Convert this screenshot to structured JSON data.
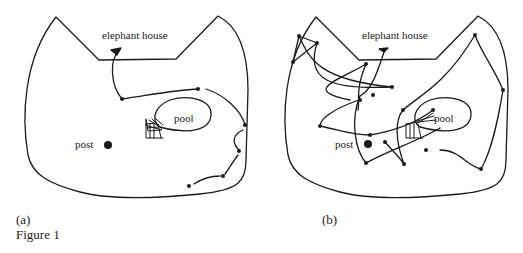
{
  "figure": {
    "caption": "Figure 1",
    "panels": [
      {
        "id": "a",
        "label": "(a)",
        "labels": {
          "elephant_house": "elephant house",
          "pool": "pool",
          "post": "post"
        }
      },
      {
        "id": "b",
        "label": "(b)",
        "labels": {
          "elephant_house": "elephant house",
          "pool": "pool",
          "post": "post"
        }
      }
    ],
    "colors": {
      "ink": "#1a1a1a",
      "background": "#ffffff"
    }
  }
}
